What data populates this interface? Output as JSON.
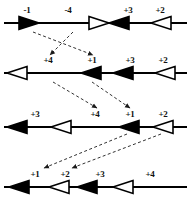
{
  "figure": {
    "width": 189,
    "height": 202,
    "stroke_color": "#000000",
    "fill_black": "#000000",
    "fill_white": "#ffffff",
    "dashed_color": "#333333"
  },
  "rows": [
    {
      "name": "row-1",
      "y": 8,
      "labels": [
        {
          "text": "-1",
          "x": 27
        },
        {
          "text": "-4",
          "x": 68
        },
        {
          "text": "+3",
          "x": 128
        },
        {
          "text": "+2",
          "x": 160
        }
      ],
      "arrows": [
        {
          "name": "arrow-minus-1",
          "x": 18,
          "direction": "right",
          "fill": "black"
        },
        {
          "name": "arrow-minus-4",
          "x": 88,
          "direction": "right",
          "fill": "white"
        },
        {
          "name": "arrow-plus-3",
          "x": 108,
          "direction": "left",
          "fill": "black"
        },
        {
          "name": "arrow-plus-2",
          "x": 150,
          "direction": "left",
          "fill": "white"
        }
      ]
    },
    {
      "name": "row-2",
      "y": 58,
      "labels": [
        {
          "text": "+4",
          "x": 48
        },
        {
          "text": "+1",
          "x": 92
        },
        {
          "text": "+3",
          "x": 130
        },
        {
          "text": "+2",
          "x": 163
        }
      ],
      "arrows": [
        {
          "name": "arrow-plus-4",
          "x": 6,
          "direction": "left",
          "fill": "white"
        },
        {
          "name": "arrow-plus-1",
          "x": 80,
          "direction": "left",
          "fill": "black"
        },
        {
          "name": "arrow-plus-3",
          "x": 112,
          "direction": "left",
          "fill": "black"
        },
        {
          "name": "arrow-plus-2",
          "x": 154,
          "direction": "left",
          "fill": "white"
        }
      ]
    },
    {
      "name": "row-3",
      "y": 112,
      "labels": [
        {
          "text": "+3",
          "x": 35
        },
        {
          "text": "+4",
          "x": 95
        },
        {
          "text": "+1",
          "x": 130
        },
        {
          "text": "+2",
          "x": 163
        }
      ],
      "arrows": [
        {
          "name": "arrow-plus-3",
          "x": 6,
          "direction": "left",
          "fill": "black"
        },
        {
          "name": "arrow-plus-4",
          "x": 50,
          "direction": "left",
          "fill": "white"
        },
        {
          "name": "arrow-plus-1",
          "x": 118,
          "direction": "left",
          "fill": "black"
        },
        {
          "name": "arrow-plus-2",
          "x": 152,
          "direction": "left",
          "fill": "white"
        }
      ]
    },
    {
      "name": "row-4",
      "y": 172,
      "labels": [
        {
          "text": "+1",
          "x": 35
        },
        {
          "text": "+2",
          "x": 65
        },
        {
          "text": "+3",
          "x": 100
        },
        {
          "text": "+4",
          "x": 150
        }
      ],
      "arrows": [
        {
          "name": "arrow-plus-1",
          "x": 8,
          "direction": "left",
          "fill": "black"
        },
        {
          "name": "arrow-plus-2",
          "x": 48,
          "direction": "left",
          "fill": "white"
        },
        {
          "name": "arrow-plus-3",
          "x": 76,
          "direction": "left",
          "fill": "black"
        },
        {
          "name": "arrow-plus-4",
          "x": 112,
          "direction": "left",
          "fill": "white"
        }
      ]
    }
  ],
  "dashed_arrows": [
    {
      "name": "dashed-arrow-1-to-2-a",
      "x1": 33,
      "y1": 32,
      "x2": 93,
      "y2": 55
    },
    {
      "name": "dashed-arrow-1-to-2-b",
      "x1": 73,
      "y1": 32,
      "x2": 50,
      "y2": 55
    },
    {
      "name": "dashed-arrow-2-to-3-a",
      "x1": 53,
      "y1": 82,
      "x2": 97,
      "y2": 108
    },
    {
      "name": "dashed-arrow-2-to-3-b",
      "x1": 92,
      "y1": 82,
      "x2": 130,
      "y2": 108
    },
    {
      "name": "dashed-arrow-3-to-4-a",
      "x1": 127,
      "y1": 134,
      "x2": 44,
      "y2": 168
    },
    {
      "name": "dashed-arrow-3-to-4-b",
      "x1": 161,
      "y1": 134,
      "x2": 72,
      "y2": 168
    }
  ]
}
